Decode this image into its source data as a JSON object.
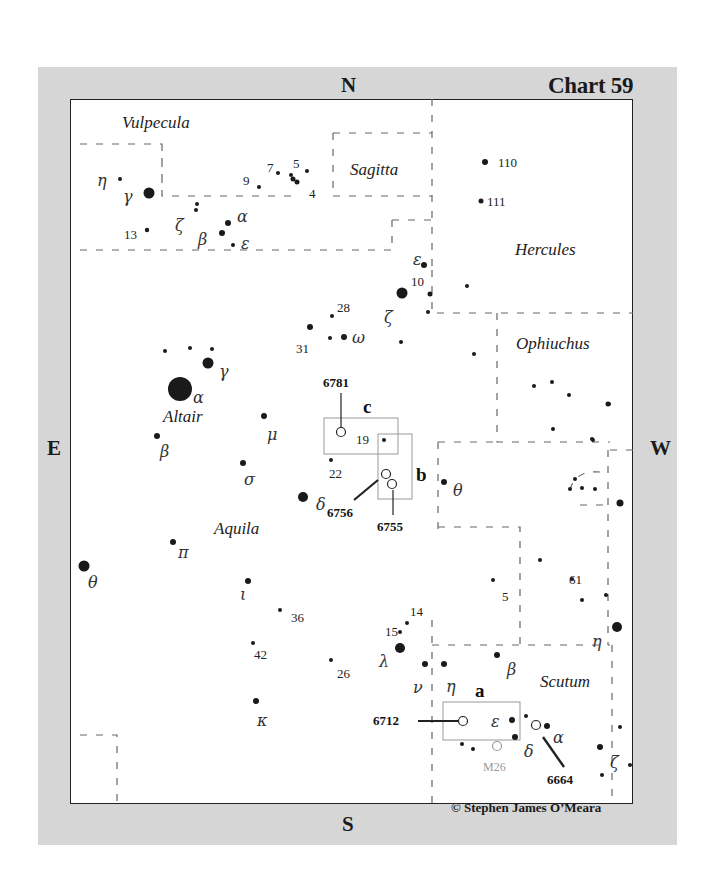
{
  "header": {
    "chart_title": "Chart 59",
    "north": "N",
    "south": "S",
    "east": "E",
    "west": "W",
    "copyright": "© Stephen James O’Meara"
  },
  "constellations": [
    {
      "name": "Vulpecula",
      "x": 122,
      "y": 128
    },
    {
      "name": "Sagitta",
      "x": 350,
      "y": 175
    },
    {
      "name": "Hercules",
      "x": 515,
      "y": 255
    },
    {
      "name": "Ophiuchus",
      "x": 516,
      "y": 349
    },
    {
      "name": "Aquila",
      "x": 214,
      "y": 534
    },
    {
      "name": "Scutum",
      "x": 540,
      "y": 687
    }
  ],
  "named_stars": [
    {
      "name": "Altair",
      "x": 163,
      "y": 422
    }
  ],
  "stars": [
    {
      "x": 120,
      "y": 179,
      "r": 2
    },
    {
      "x": 149,
      "y": 193,
      "r": 5.5
    },
    {
      "x": 196,
      "y": 210,
      "r": 2
    },
    {
      "x": 197,
      "y": 204,
      "r": 2
    },
    {
      "x": 147,
      "y": 230,
      "r": 2.2
    },
    {
      "x": 222,
      "y": 233,
      "r": 3
    },
    {
      "x": 228,
      "y": 223,
      "r": 3
    },
    {
      "x": 233,
      "y": 245,
      "r": 2
    },
    {
      "x": 259,
      "y": 187,
      "r": 2
    },
    {
      "x": 278,
      "y": 173,
      "r": 2
    },
    {
      "x": 291,
      "y": 175,
      "r": 2
    },
    {
      "x": 293,
      "y": 179,
      "r": 2.5
    },
    {
      "x": 297,
      "y": 182,
      "r": 2.5
    },
    {
      "x": 307,
      "y": 171,
      "r": 2
    },
    {
      "x": 485,
      "y": 162,
      "r": 3
    },
    {
      "x": 481,
      "y": 201,
      "r": 2.5
    },
    {
      "x": 424,
      "y": 265,
      "r": 3
    },
    {
      "x": 402,
      "y": 293,
      "r": 5.5
    },
    {
      "x": 430,
      "y": 294,
      "r": 2.5
    },
    {
      "x": 467,
      "y": 286,
      "r": 2
    },
    {
      "x": 428,
      "y": 312,
      "r": 2
    },
    {
      "x": 332,
      "y": 316,
      "r": 2
    },
    {
      "x": 310,
      "y": 327,
      "r": 3
    },
    {
      "x": 330,
      "y": 338,
      "r": 2
    },
    {
      "x": 344,
      "y": 337,
      "r": 3
    },
    {
      "x": 401,
      "y": 342,
      "r": 2
    },
    {
      "x": 474,
      "y": 354,
      "r": 2
    },
    {
      "x": 534,
      "y": 386,
      "r": 2
    },
    {
      "x": 552,
      "y": 382,
      "r": 2
    },
    {
      "x": 569,
      "y": 395,
      "r": 2
    },
    {
      "x": 608,
      "y": 404,
      "r": 2.5
    },
    {
      "x": 553,
      "y": 429,
      "r": 2
    },
    {
      "x": 592,
      "y": 439,
      "r": 2
    },
    {
      "x": 609,
      "y": 404,
      "r": 2
    },
    {
      "x": 165,
      "y": 351,
      "r": 2
    },
    {
      "x": 190,
      "y": 348,
      "r": 2
    },
    {
      "x": 212,
      "y": 349,
      "r": 2
    },
    {
      "x": 208,
      "y": 363,
      "r": 5.5
    },
    {
      "x": 180,
      "y": 389,
      "r": 12
    },
    {
      "x": 264,
      "y": 416,
      "r": 3
    },
    {
      "x": 157,
      "y": 436,
      "r": 3
    },
    {
      "x": 243,
      "y": 463,
      "r": 3
    },
    {
      "x": 303,
      "y": 497,
      "r": 5
    },
    {
      "x": 331,
      "y": 460,
      "r": 2
    },
    {
      "x": 384,
      "y": 440,
      "r": 2
    },
    {
      "x": 444,
      "y": 482,
      "r": 3
    },
    {
      "x": 593,
      "y": 440,
      "r": 2
    },
    {
      "x": 575,
      "y": 479,
      "r": 2
    },
    {
      "x": 582,
      "y": 488,
      "r": 2
    },
    {
      "x": 570,
      "y": 489,
      "r": 2
    },
    {
      "x": 595,
      "y": 489,
      "r": 2
    },
    {
      "x": 620,
      "y": 503,
      "r": 3.5
    },
    {
      "x": 84,
      "y": 566,
      "r": 5.5
    },
    {
      "x": 173,
      "y": 542,
      "r": 3
    },
    {
      "x": 248,
      "y": 581,
      "r": 3
    },
    {
      "x": 280,
      "y": 610,
      "r": 2
    },
    {
      "x": 253,
      "y": 643,
      "r": 2
    },
    {
      "x": 331,
      "y": 660,
      "r": 2
    },
    {
      "x": 256,
      "y": 701,
      "r": 3
    },
    {
      "x": 407,
      "y": 623,
      "r": 2
    },
    {
      "x": 400,
      "y": 632,
      "r": 2
    },
    {
      "x": 400,
      "y": 648,
      "r": 5
    },
    {
      "x": 425,
      "y": 664,
      "r": 3
    },
    {
      "x": 444,
      "y": 664,
      "r": 3
    },
    {
      "x": 497,
      "y": 655,
      "r": 3
    },
    {
      "x": 493,
      "y": 580,
      "r": 2
    },
    {
      "x": 540,
      "y": 560,
      "r": 2
    },
    {
      "x": 572,
      "y": 579,
      "r": 2
    },
    {
      "x": 582,
      "y": 600,
      "r": 2
    },
    {
      "x": 606,
      "y": 595,
      "r": 2
    },
    {
      "x": 617,
      "y": 627,
      "r": 5
    },
    {
      "x": 512,
      "y": 720,
      "r": 3
    },
    {
      "x": 526,
      "y": 716,
      "r": 2
    },
    {
      "x": 515,
      "y": 737,
      "r": 3
    },
    {
      "x": 547,
      "y": 726,
      "r": 3
    },
    {
      "x": 462,
      "y": 744,
      "r": 2
    },
    {
      "x": 473,
      "y": 749,
      "r": 2
    },
    {
      "x": 600,
      "y": 747,
      "r": 3
    },
    {
      "x": 620,
      "y": 727,
      "r": 2
    },
    {
      "x": 630,
      "y": 765,
      "r": 2
    },
    {
      "x": 602,
      "y": 775,
      "r": 2
    }
  ],
  "greek_labels": [
    {
      "t": "η",
      "x": 97,
      "y": 186
    },
    {
      "t": "γ",
      "x": 123,
      "y": 202
    },
    {
      "t": "ζ",
      "x": 175,
      "y": 231
    },
    {
      "t": "β",
      "x": 198,
      "y": 245
    },
    {
      "t": "α",
      "x": 237,
      "y": 222
    },
    {
      "t": "ε",
      "x": 241,
      "y": 249
    },
    {
      "t": "ε",
      "x": 413,
      "y": 265
    },
    {
      "t": "ζ",
      "x": 384,
      "y": 323
    },
    {
      "t": "ω",
      "x": 352,
      "y": 343
    },
    {
      "t": "γ",
      "x": 219,
      "y": 377
    },
    {
      "t": "α",
      "x": 193,
      "y": 403
    },
    {
      "t": "μ",
      "x": 267,
      "y": 440
    },
    {
      "t": "β",
      "x": 160,
      "y": 457
    },
    {
      "t": "σ",
      "x": 244,
      "y": 485
    },
    {
      "t": "δ",
      "x": 316,
      "y": 510
    },
    {
      "t": "θ",
      "x": 453,
      "y": 496
    },
    {
      "t": "π",
      "x": 178,
      "y": 558
    },
    {
      "t": "θ",
      "x": 88,
      "y": 588
    },
    {
      "t": "ι",
      "x": 240,
      "y": 600
    },
    {
      "t": "λ",
      "x": 379,
      "y": 667
    },
    {
      "t": "ν",
      "x": 413,
      "y": 693
    },
    {
      "t": "η",
      "x": 446,
      "y": 692
    },
    {
      "t": "β",
      "x": 507,
      "y": 675
    },
    {
      "t": "η",
      "x": 592,
      "y": 647
    },
    {
      "t": "κ",
      "x": 257,
      "y": 726
    },
    {
      "t": "ε",
      "x": 491,
      "y": 727
    },
    {
      "t": "δ",
      "x": 524,
      "y": 757
    },
    {
      "t": "α",
      "x": 553,
      "y": 743
    },
    {
      "t": "ζ",
      "x": 610,
      "y": 768
    }
  ],
  "number_labels": [
    {
      "t": "13",
      "x": 124,
      "y": 239
    },
    {
      "t": "9",
      "x": 243,
      "y": 185
    },
    {
      "t": "7",
      "x": 267,
      "y": 172
    },
    {
      "t": "5",
      "x": 293,
      "y": 168
    },
    {
      "t": "4",
      "x": 309,
      "y": 198
    },
    {
      "t": "110",
      "x": 498,
      "y": 167
    },
    {
      "t": "111",
      "x": 487,
      "y": 206
    },
    {
      "t": "10",
      "x": 411,
      "y": 286
    },
    {
      "t": "28",
      "x": 337,
      "y": 312
    },
    {
      "t": "31",
      "x": 296,
      "y": 353
    },
    {
      "t": "19",
      "x": 356,
      "y": 444
    },
    {
      "t": "22",
      "x": 329,
      "y": 478
    },
    {
      "t": "5",
      "x": 502,
      "y": 601
    },
    {
      "t": "61",
      "x": 569,
      "y": 584
    },
    {
      "t": "36",
      "x": 291,
      "y": 622
    },
    {
      "t": "42",
      "x": 254,
      "y": 659
    },
    {
      "t": "26",
      "x": 337,
      "y": 678
    },
    {
      "t": "14",
      "x": 410,
      "y": 616
    },
    {
      "t": "15",
      "x": 385,
      "y": 636
    }
  ],
  "deep_sky_objects": [
    {
      "id": "6781",
      "field": "c",
      "x": 341,
      "y": 432,
      "label_x": 323,
      "label_y": 387
    },
    {
      "id": "6756",
      "field": "b",
      "x": 386,
      "y": 474,
      "label_x": 327,
      "label_y": 517
    },
    {
      "id": "6755",
      "field": "b",
      "x": 392,
      "y": 484,
      "label_x": 377,
      "label_y": 531
    },
    {
      "id": "6712",
      "field": "a",
      "x": 463,
      "y": 721,
      "label_x": 373,
      "label_y": 725
    },
    {
      "id": "6664",
      "field": "",
      "x": 536,
      "y": 725,
      "label_x": 547,
      "label_y": 784
    },
    {
      "id": "M26",
      "field": "",
      "x": 497,
      "y": 746,
      "label_x": 483,
      "label_y": 771
    }
  ],
  "fields": [
    {
      "letter": "c",
      "x": 324,
      "y": 418,
      "w": 74,
      "h": 36,
      "lx": 363,
      "ly": 413
    },
    {
      "letter": "b",
      "x": 378,
      "y": 434,
      "w": 34,
      "h": 65,
      "lx": 416,
      "ly": 481
    },
    {
      "letter": "a",
      "x": 443,
      "y": 702,
      "w": 77,
      "h": 38,
      "lx": 475,
      "ly": 697
    }
  ]
}
